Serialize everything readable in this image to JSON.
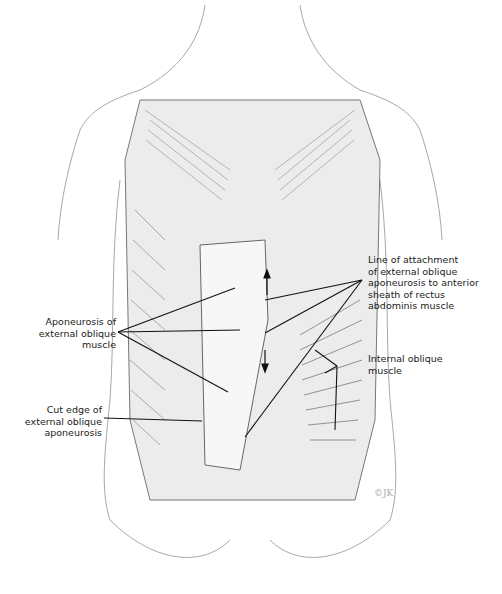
{
  "figure": {
    "type": "anatomical illustration"
  },
  "labels": {
    "aponeurosis": "Aponeurosis of\nexternal oblique\nmuscle",
    "cut_edge": "Cut edge of\nexternal oblique\naponeurosis",
    "line_of_attachment": "Line of attachment\nof external oblique\naponeurosis to anterior\nsheath of rectus\nabdominis muscle",
    "internal_oblique": "Internal oblique\nmuscle"
  },
  "signature": "©JK",
  "colors": {
    "ink": "#222222",
    "skin_outline": "#9a9a9a",
    "muscle_shade": "#8c8c8c",
    "aponeurosis_fill": "#f2f2f2"
  }
}
